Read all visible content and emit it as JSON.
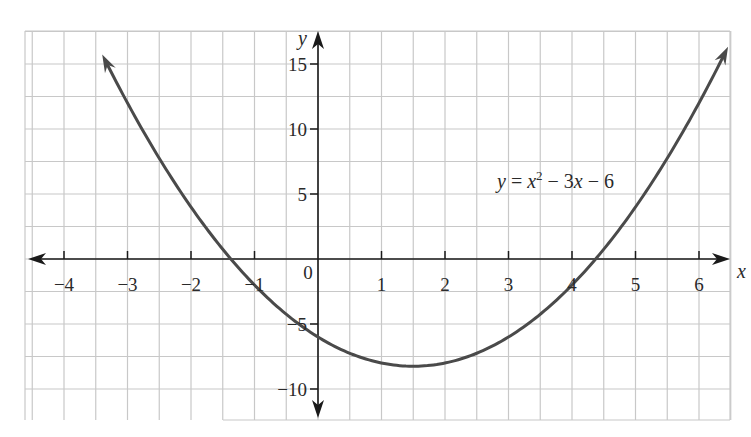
{
  "chart_data": {
    "type": "line",
    "title": "",
    "equation_label": "y = x² − 3x − 6",
    "xlabel": "x",
    "ylabel": "y",
    "xlim": [
      -4.5,
      6.6
    ],
    "ylim": [
      -12.5,
      17.5
    ],
    "x_ticks": [
      -4,
      -3,
      -2,
      -1,
      0,
      1,
      2,
      3,
      4,
      5,
      6
    ],
    "x_tick_labels": [
      "−4",
      "−3",
      "−2",
      "−1",
      "0",
      "1",
      "2",
      "3",
      "4",
      "5",
      "6"
    ],
    "y_ticks": [
      15,
      10,
      5,
      -5,
      -10
    ],
    "y_tick_labels": [
      "15",
      "10",
      "5",
      "−5",
      "−10"
    ],
    "grid": true,
    "grid_spacing": {
      "x": 0.5,
      "y": 2.5
    },
    "series": [
      {
        "name": "y = x^2 - 3x - 6",
        "function": "x^2 - 3x - 6",
        "x": [
          -3.4,
          -3,
          -2,
          -1.37,
          -1,
          0,
          1,
          1.5,
          2,
          3,
          4,
          4.37,
          5,
          6,
          6.45
        ],
        "values": [
          15.76,
          12,
          4,
          0,
          -2,
          -6,
          -8,
          -8.25,
          -8,
          -6,
          -2,
          0,
          4,
          12,
          16.25
        ]
      }
    ],
    "key_points": {
      "vertex": [
        1.5,
        -8.25
      ],
      "x_intercepts": [
        -1.37,
        4.37
      ],
      "y_intercept": -6
    },
    "colors": {
      "curve": "#4a4a4a",
      "axes": "#1a1a1a",
      "grid": "#c8c8c8"
    }
  }
}
